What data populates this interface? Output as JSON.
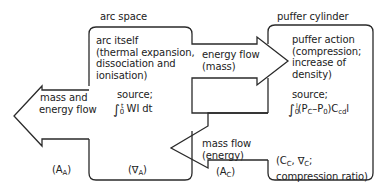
{
  "diagram": {
    "regions": {
      "arc_space": {
        "title": "arc space",
        "description": [
          "arc itself",
          "(thermal expansion,",
          "dissociation and",
          "ionisation)"
        ],
        "source_label": "source;",
        "source_formula": {
          "integral_upper": "t",
          "integral_lower": "0",
          "integrand": "WI dt"
        },
        "area_label": {
          "main": "(∇",
          "sub": "A",
          "close": ")"
        }
      },
      "puffer_cylinder": {
        "title": "puffer cylinder",
        "description": [
          "puffer action",
          "(compression;",
          "increase of",
          "density)"
        ],
        "source_label": "source;",
        "source_formula": {
          "integral_upper": "l",
          "integral_lower": "0",
          "integrand_parts": [
            "(P",
            "C",
            "–P",
            "0",
            ")C",
            "cd",
            "l"
          ]
        },
        "params_label": {
          "line1_parts": [
            "(C",
            "C",
            ", ∇",
            "C",
            ";"
          ],
          "line2": "compression ratio)"
        }
      }
    },
    "flows": [
      {
        "id": "outflow",
        "direction": "left",
        "label": [
          "mass and",
          "energy flow"
        ],
        "area_label": {
          "main": "(A",
          "sub": "A",
          "close": ")"
        }
      },
      {
        "id": "energy-flow",
        "direction": "right",
        "label": [
          "energy flow",
          "(mass)"
        ]
      },
      {
        "id": "mass-flow",
        "direction": "left",
        "label": [
          "mass flow",
          "(energy)"
        ],
        "area_label": {
          "main": "(A",
          "sub": "C",
          "close": ")"
        }
      }
    ],
    "colors": {
      "stroke": "#2a2a2a",
      "text": "#222222",
      "background": "#ffffff"
    }
  }
}
